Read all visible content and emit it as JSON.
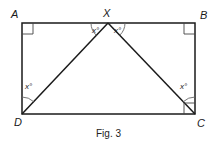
{
  "figure": {
    "caption": "Fig. 3",
    "points": {
      "A": {
        "label": "A",
        "x": 22,
        "y": 23
      },
      "X": {
        "label": "X",
        "x": 108,
        "y": 23
      },
      "B": {
        "label": "B",
        "x": 195,
        "y": 23
      },
      "D": {
        "label": "D",
        "x": 22,
        "y": 114
      },
      "C": {
        "label": "C",
        "x": 195,
        "y": 114
      }
    },
    "angle_labels": {
      "AXD": "x°",
      "BXC": "x°",
      "ADX": "x°",
      "BCX": "x°"
    },
    "right_angles": [
      "A",
      "B",
      "C"
    ],
    "segments": [
      "AB",
      "BC",
      "CD",
      "DA",
      "XD",
      "XC"
    ],
    "stroke_color": "#1a1a1a"
  }
}
